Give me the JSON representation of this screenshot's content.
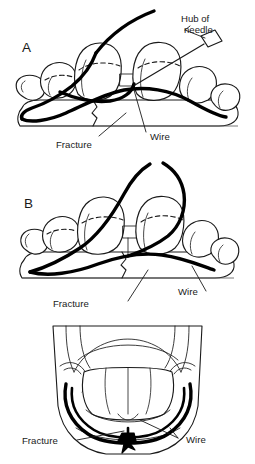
{
  "figure": {
    "background_color": "#ffffff",
    "line_color": "#1a1a1a",
    "wire_color": "#000000",
    "width": 255,
    "height": 464
  },
  "panels": [
    {
      "id": "a",
      "letter": "A",
      "view": "lateral view of mandible and teeth, needle passing wire around teeth",
      "labels": [
        {
          "key": "hub",
          "text": "Hub of",
          "name": "label-hub-of-needle-line1"
        },
        {
          "key": "needle",
          "text": "needle",
          "name": "label-hub-of-needle-line2"
        },
        {
          "key": "fracture",
          "text": "Fracture",
          "name": "label-fracture"
        },
        {
          "key": "wire",
          "text": "Wire",
          "name": "label-wire"
        }
      ]
    },
    {
      "id": "b",
      "letter": "B",
      "view": "lateral view with wire ends crossed above the teeth ready to twist",
      "labels": [
        {
          "key": "fracture",
          "text": "Fracture",
          "name": "label-fracture"
        },
        {
          "key": "wire",
          "text": "Wire",
          "name": "label-wire"
        }
      ]
    },
    {
      "id": "c",
      "letter": "",
      "view": "anterior view of mandible with wire twisted into a knot at the midline",
      "labels": [
        {
          "key": "fracture",
          "text": "Fracture",
          "name": "label-fracture"
        },
        {
          "key": "wire",
          "text": "Wire",
          "name": "label-wire"
        }
      ]
    }
  ]
}
